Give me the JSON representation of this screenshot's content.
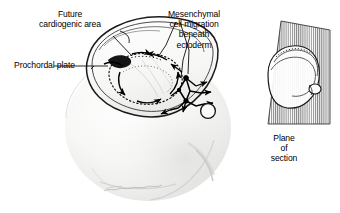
{
  "figure": {
    "background_color": "#ffffff",
    "ink_color": "#000000",
    "width": 340,
    "height": 213
  },
  "labels": {
    "future_cardiogenic_area": "Future\ncardiogenic area",
    "prochordal_plate": "Prochordal plate",
    "mesenchymal_migration": "Mesenchymal\ncell migration\nbeneath\nectoderm",
    "plane_of_section": "Plane\nof\nsection"
  },
  "artist_signature": {
    "text": "",
    "description": "faint cursive signature"
  },
  "main_view": {
    "name": "cut-away embryo with yolk sac",
    "parts": [
      "amniotic cavity rim",
      "embryonic disc",
      "prochordal plate",
      "cardiogenic crescent",
      "mesenchymal cells",
      "connecting stalk",
      "yolk sac"
    ]
  },
  "inset_view": {
    "name": "orientation inset",
    "parts": [
      "whole embryo sac",
      "hatched section plane",
      "embryo body"
    ]
  }
}
